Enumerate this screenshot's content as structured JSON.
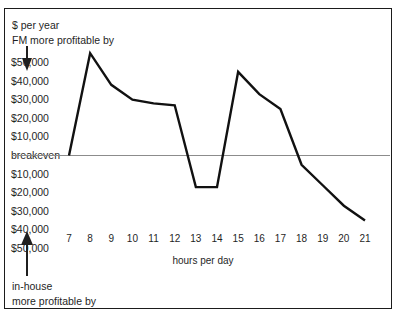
{
  "figure": {
    "frame_color": "#1b1b1b",
    "background": "#ffffff",
    "line_color": "#111111",
    "baseline_color": "#8c8c8c"
  },
  "annotations": {
    "top_line1": "$ per year",
    "top_line2": "FM more profitable by",
    "top_arrow": "arrow-down-icon",
    "bottom_line1": "in-house",
    "bottom_line2": "more profitable by",
    "bottom_arrow": "arrow-up-icon"
  },
  "chart_data": {
    "type": "line",
    "title": "",
    "subtitle": "",
    "xlabel": "hours per day",
    "ylabel": "$ per year",
    "grid": false,
    "legend": null,
    "x": [
      7,
      8,
      9,
      10,
      11,
      12,
      13,
      14,
      15,
      16,
      17,
      18,
      19,
      20,
      21
    ],
    "values": [
      0,
      55000,
      38000,
      30000,
      28000,
      27000,
      -17000,
      -17000,
      45000,
      33000,
      25000,
      -5000,
      -16000,
      -27000,
      -35000
    ],
    "xlim": [
      7,
      21
    ],
    "ylim": [
      -50000,
      55000
    ],
    "xticks": [
      7,
      8,
      9,
      10,
      11,
      12,
      13,
      14,
      15,
      16,
      17,
      18,
      19,
      20,
      21
    ],
    "xticklabels": [
      "7",
      "8",
      "9",
      "10",
      "11",
      "12",
      "13",
      "14",
      "15",
      "16",
      "17",
      "18",
      "19",
      "20",
      "21"
    ],
    "yticks": [
      50000,
      40000,
      30000,
      20000,
      10000,
      0,
      -10000,
      -20000,
      -30000,
      -40000,
      -50000
    ],
    "yticklabels": [
      "$50,000",
      "$40,000",
      "$30,000",
      "$20,000",
      "$10,000",
      "breakeven",
      "$10,000",
      "$20,000",
      "$30,000",
      "$40,000",
      "$50,000"
    ],
    "baseline_label": "breakeven",
    "baseline_value": 0,
    "series_name": "FM vs in-house profitability difference"
  }
}
